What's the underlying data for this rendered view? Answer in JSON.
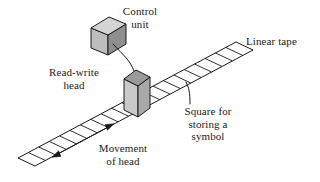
{
  "figure": {
    "background_color": "#ffffff",
    "line_color": "#1a1a1a",
    "text_color": "#1a1a1a",
    "labels": {
      "control_unit": "Control\nunit",
      "linear_tape": "Linear tape",
      "read_write_head": "Read-write\nhead",
      "square_for_storing": "Square for\nstoring a\nsymbol",
      "movement_of_head": "Movement\nof head"
    },
    "parts": {
      "control_unit_box": {
        "name": "control-unit",
        "shape": "isometric-cube",
        "top_face_color": "#d4d4d4",
        "front_face_color": "#bdbdbd",
        "side_face_color": "#8f8f8f"
      },
      "read_write_head_box": {
        "name": "read-write-head",
        "shape": "isometric-tall-box",
        "top_face_color": "#9a9a9a",
        "front_face_color": "#c9c9c9",
        "side_face_color": "#a8a8a8"
      },
      "tape": {
        "name": "linear-tape",
        "shape": "parallelogram-strip",
        "fill_color": "#ffffff",
        "cell_count": 21
      },
      "movement_arrow": {
        "name": "movement-arrow",
        "type": "double-headed",
        "direction": "along-tape"
      },
      "control_cable": {
        "name": "control-cable",
        "type": "curved-line"
      },
      "square_leader": {
        "name": "square-leader-line",
        "type": "straight-line"
      }
    }
  }
}
